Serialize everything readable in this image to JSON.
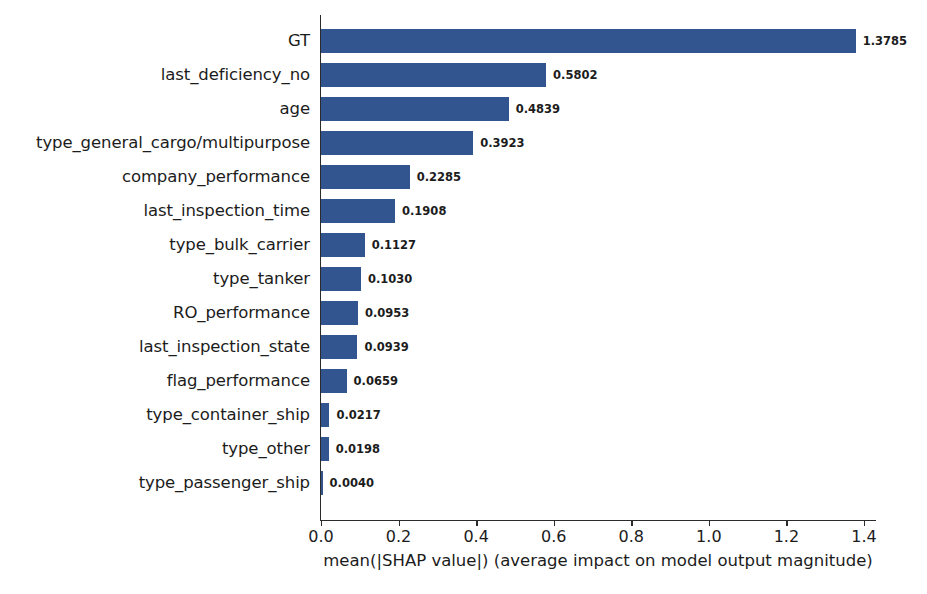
{
  "chart_data": {
    "type": "bar",
    "orientation": "horizontal",
    "title": "",
    "xlabel": "mean(|SHAP value|) (average impact on model output magnitude)",
    "ylabel": "",
    "xlim": [
      0.0,
      1.4
    ],
    "xticks": [
      "0.0",
      "0.2",
      "0.4",
      "0.6",
      "0.8",
      "1.0",
      "1.2",
      "1.4"
    ],
    "xtick_values": [
      0.0,
      0.2,
      0.4,
      0.6,
      0.8,
      1.0,
      1.2,
      1.4
    ],
    "grid": false,
    "legend": false,
    "bar_color": "#32548f",
    "categories": [
      "GT",
      "last_deficiency_no",
      "age",
      "type_general_cargo/multipurpose",
      "company_performance",
      "last_inspection_time",
      "type_bulk_carrier",
      "type_tanker",
      "RO_performance",
      "last_inspection_state",
      "flag_performance",
      "type_container_ship",
      "type_other",
      "type_passenger_ship"
    ],
    "values": [
      1.3785,
      0.5802,
      0.4839,
      0.3923,
      0.2285,
      0.1908,
      0.1127,
      0.103,
      0.0953,
      0.0939,
      0.0659,
      0.0217,
      0.0198,
      0.004
    ],
    "value_labels": [
      "1.3785",
      "0.5802",
      "0.4839",
      "0.3923",
      "0.2285",
      "0.1908",
      "0.1127",
      "0.1030",
      "0.0953",
      "0.0939",
      "0.0659",
      "0.0217",
      "0.0198",
      "0.0040"
    ]
  }
}
